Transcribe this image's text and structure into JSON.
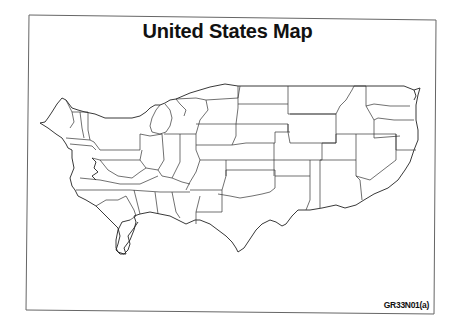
{
  "title": "United States Map",
  "footnote": "GR33N01(a)",
  "map": {
    "region": "Contiguous United States",
    "orientation": "horizontally mirrored (east on left, west on right)",
    "projection": "outline map of state boundaries",
    "fill_color": "#ffffff",
    "stroke_color": "#333333",
    "frame_color": "#555555",
    "states_shown": [
      "ME",
      "NH",
      "VT",
      "MA",
      "RI",
      "CT",
      "NY",
      "NJ",
      "PA",
      "DE",
      "MD",
      "VA",
      "WV",
      "NC",
      "SC",
      "GA",
      "FL",
      "AL",
      "MS",
      "TN",
      "KY",
      "OH",
      "MI",
      "IN",
      "IL",
      "WI",
      "MN",
      "IA",
      "MO",
      "AR",
      "LA",
      "TX",
      "OK",
      "KS",
      "NE",
      "SD",
      "ND",
      "MT",
      "WY",
      "CO",
      "NM",
      "AZ",
      "UT",
      "NV",
      "ID",
      "OR",
      "WA",
      "CA"
    ]
  }
}
